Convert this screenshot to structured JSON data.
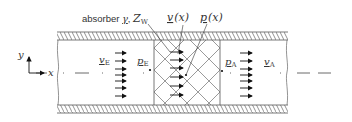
{
  "diagram": {
    "labels": {
      "absorber_prefix": "absorber",
      "absorber_gamma": "γ",
      "absorber_sep": ",",
      "absorber_Z": "Z",
      "absorber_Z_sub": "W",
      "v_x": "v",
      "v_x_arg": "(x)",
      "p_x": "p",
      "p_x_arg": "(x)",
      "v_E": "v",
      "v_E_sub": "E",
      "p_E": "p",
      "p_E_sub": "E",
      "p_A": "p",
      "p_A_sub": "A",
      "v_A": "v",
      "v_A_sub": "A",
      "axis_y": "y",
      "axis_x": "x"
    },
    "regions": [
      {
        "name": "entry-section",
        "x_start": 57,
        "x_end": 154
      },
      {
        "name": "absorber-section",
        "x_start": 154,
        "x_end": 220
      },
      {
        "name": "exit-section",
        "x_start": 220,
        "x_end": 288
      }
    ],
    "flow_arrows_count": 7,
    "colors": {
      "line": "#555555",
      "hatch": "#666666",
      "arrow": "#111111",
      "text": "#333333"
    }
  }
}
